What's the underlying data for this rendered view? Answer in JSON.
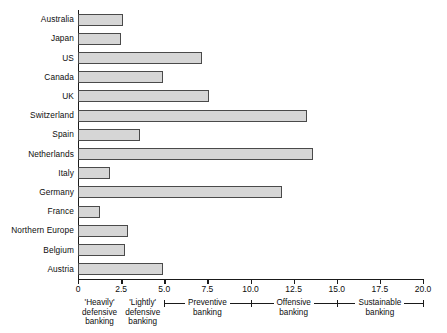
{
  "chart_data": {
    "type": "bar",
    "orientation": "horizontal",
    "title": "",
    "xlabel": "",
    "ylabel": "",
    "xlim": [
      0,
      20
    ],
    "grid": false,
    "legend": "none",
    "categories": [
      "Australia",
      "Japan",
      "US",
      "Canada",
      "UK",
      "Switzerland",
      "Spain",
      "Netherlands",
      "Italy",
      "Germany",
      "France",
      "Northern Europe",
      "Belgium",
      "Austria"
    ],
    "values": [
      2.6,
      2.5,
      7.2,
      4.9,
      7.6,
      13.3,
      3.6,
      13.6,
      1.85,
      11.8,
      1.25,
      2.9,
      2.7,
      4.9
    ],
    "xticks": [
      0,
      2.5,
      5.0,
      7.5,
      10.0,
      12.5,
      15.0,
      17.5,
      20.0
    ],
    "xtick_labels": [
      "0",
      "2.5",
      "5.0",
      "7.5",
      "10.0",
      "12.5",
      "15.0",
      "17.5",
      "20.0"
    ],
    "zones": [
      {
        "label_lines": [
          "'Heavily'",
          "defensive",
          "banking"
        ],
        "start": 0.0,
        "end": 2.5,
        "bracket": false
      },
      {
        "label_lines": [
          "'Lightly'",
          "defensive",
          "banking"
        ],
        "start": 2.5,
        "end": 5.0,
        "bracket": false
      },
      {
        "label_lines": [
          "Preventive",
          "banking"
        ],
        "start": 5.0,
        "end": 10.0,
        "bracket": true
      },
      {
        "label_lines": [
          "Offensive",
          "banking"
        ],
        "start": 10.0,
        "end": 15.0,
        "bracket": true
      },
      {
        "label_lines": [
          "Sustainable",
          "banking"
        ],
        "start": 15.0,
        "end": 20.0,
        "bracket": true
      }
    ]
  },
  "style": {
    "bar_fill": "#d6d6d6",
    "bar_stroke": "#4a4a4a",
    "axis_color": "#1a1a1a",
    "text_color": "#0d0d0d",
    "background": "#ffffff"
  }
}
